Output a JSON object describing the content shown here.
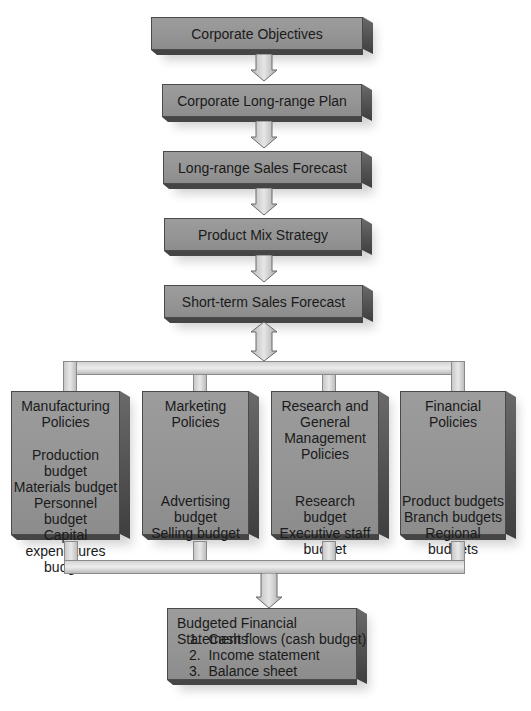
{
  "diagram": {
    "type": "flowchart",
    "colors": {
      "box_face": "#969696",
      "box_side": "#4e4e4e",
      "connector": "#dcdcdc",
      "outline": "#4a4a4a",
      "text": "#1a1a1a"
    },
    "chain": [
      {
        "id": "corporate-objectives",
        "label": "Corporate Objectives"
      },
      {
        "id": "corporate-long-range-plan",
        "label": "Corporate Long-range Plan"
      },
      {
        "id": "long-range-sales-forecast",
        "label": "Long-range Sales Forecast"
      },
      {
        "id": "product-mix-strategy",
        "label": "Product Mix Strategy"
      },
      {
        "id": "short-term-sales-forecast",
        "label": "Short-term Sales Forecast"
      }
    ],
    "policies": [
      {
        "title_lines": [
          "Manufacturing",
          "Policies"
        ],
        "items": [
          "Production budget",
          "Materials budget",
          "Personnel budget",
          "Capital",
          "expenditures",
          "budget"
        ]
      },
      {
        "title_lines": [
          "Marketing",
          "Policies"
        ],
        "items": [
          "Advertising budget",
          "Selling budget"
        ]
      },
      {
        "title_lines": [
          "Research and",
          "General",
          "Management",
          "Policies"
        ],
        "items": [
          "Research budget",
          "Executive staff",
          "budget"
        ]
      },
      {
        "title_lines": [
          "Financial",
          "Policies"
        ],
        "items": [
          "Product budgets",
          "Branch budgets",
          "Regional budgets"
        ]
      }
    ],
    "final": {
      "title": "Budgeted Financial Statements",
      "items": [
        "1.  Cash flows (cash budget)",
        "2.  Income statement",
        "3.  Balance sheet"
      ]
    }
  }
}
